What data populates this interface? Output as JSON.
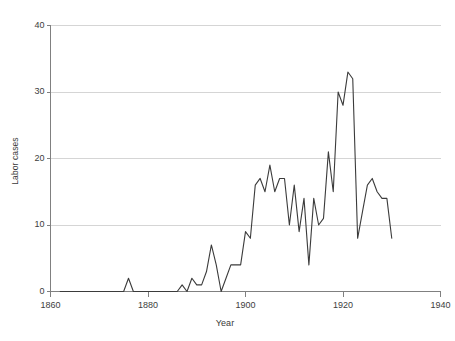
{
  "chart_data": {
    "type": "line",
    "title": "",
    "xlabel": "Year",
    "ylabel": "Labor cases",
    "xlim": [
      1860,
      1940
    ],
    "ylim": [
      0,
      40
    ],
    "xticks": [
      1860,
      1880,
      1900,
      1920,
      1940
    ],
    "yticks": [
      0,
      10,
      20,
      30,
      40
    ],
    "xtick_labels": [
      "1860",
      "1880",
      "1900",
      "1920",
      "1940"
    ],
    "ytick_labels": [
      "0",
      "10",
      "20",
      "30",
      "40"
    ],
    "grid": "horizontal",
    "legend": "none",
    "line_color": "#3b3b3b",
    "grid_color": "#d5d5d5",
    "axis_color": "#808080",
    "background": "#ffffff",
    "series": [
      {
        "name": "Labor cases",
        "x": [
          1862,
          1863,
          1864,
          1865,
          1866,
          1867,
          1868,
          1869,
          1870,
          1871,
          1872,
          1873,
          1874,
          1875,
          1876,
          1877,
          1878,
          1879,
          1880,
          1881,
          1882,
          1883,
          1884,
          1885,
          1886,
          1887,
          1888,
          1889,
          1890,
          1891,
          1892,
          1893,
          1894,
          1895,
          1896,
          1897,
          1898,
          1899,
          1900,
          1901,
          1902,
          1903,
          1904,
          1905,
          1906,
          1907,
          1908,
          1909,
          1910,
          1911,
          1912,
          1913,
          1914,
          1915,
          1916,
          1917,
          1918,
          1919,
          1920,
          1921,
          1922,
          1923,
          1924,
          1925,
          1926,
          1927,
          1928,
          1929,
          1930
        ],
        "y": [
          0,
          0,
          0,
          0,
          0,
          0,
          0,
          0,
          0,
          0,
          0,
          0,
          0,
          0,
          2,
          0,
          0,
          0,
          0,
          0,
          0,
          0,
          0,
          0,
          0,
          1,
          0,
          2,
          1,
          1,
          3,
          7,
          4,
          0,
          2,
          4,
          4,
          4,
          9,
          8,
          16,
          17,
          15,
          19,
          15,
          17,
          17,
          10,
          16,
          9,
          14,
          4,
          14,
          10,
          11,
          21,
          15,
          30,
          28,
          33,
          32,
          8,
          12,
          16,
          17,
          15,
          14,
          14,
          8
        ]
      }
    ]
  },
  "footer": {
    "ghost_text": ""
  }
}
